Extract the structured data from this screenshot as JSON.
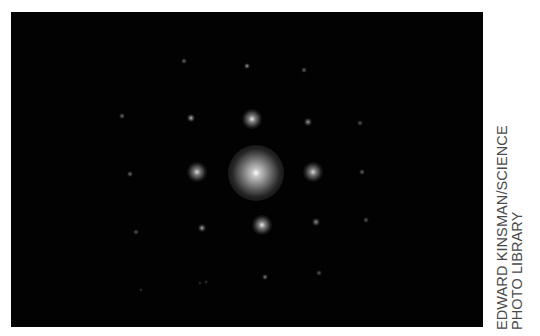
{
  "image": {
    "subject": "diffraction pattern",
    "background_color": "#020202",
    "spots": [
      {
        "x": 256,
        "y": 173,
        "r": 28,
        "intensity": 1.0,
        "kind": "central"
      },
      {
        "x": 252,
        "y": 119,
        "r": 10,
        "intensity": 0.9
      },
      {
        "x": 197,
        "y": 172,
        "r": 10,
        "intensity": 0.85
      },
      {
        "x": 313,
        "y": 172,
        "r": 10,
        "intensity": 0.85
      },
      {
        "x": 262,
        "y": 225,
        "r": 10,
        "intensity": 0.9
      },
      {
        "x": 191,
        "y": 118,
        "r": 4,
        "intensity": 0.75
      },
      {
        "x": 308,
        "y": 122,
        "r": 4,
        "intensity": 0.65
      },
      {
        "x": 202,
        "y": 228,
        "r": 4,
        "intensity": 0.7
      },
      {
        "x": 316,
        "y": 222,
        "r": 4,
        "intensity": 0.6
      },
      {
        "x": 247,
        "y": 66,
        "r": 3,
        "intensity": 0.65
      },
      {
        "x": 184,
        "y": 61,
        "r": 3,
        "intensity": 0.45
      },
      {
        "x": 304,
        "y": 70,
        "r": 3,
        "intensity": 0.45
      },
      {
        "x": 122,
        "y": 116,
        "r": 3,
        "intensity": 0.5
      },
      {
        "x": 130,
        "y": 174,
        "r": 3,
        "intensity": 0.5
      },
      {
        "x": 136,
        "y": 232,
        "r": 3,
        "intensity": 0.4
      },
      {
        "x": 360,
        "y": 123,
        "r": 3,
        "intensity": 0.4
      },
      {
        "x": 362,
        "y": 172,
        "r": 3,
        "intensity": 0.45
      },
      {
        "x": 366,
        "y": 220,
        "r": 3,
        "intensity": 0.4
      },
      {
        "x": 265,
        "y": 277,
        "r": 3,
        "intensity": 0.55
      },
      {
        "x": 206,
        "y": 282,
        "r": 2,
        "intensity": 0.3
      },
      {
        "x": 319,
        "y": 273,
        "r": 3,
        "intensity": 0.4
      },
      {
        "x": 200,
        "y": 283,
        "r": 2,
        "intensity": 0.25
      },
      {
        "x": 141,
        "y": 290,
        "r": 2,
        "intensity": 0.25
      }
    ]
  },
  "credit": {
    "line1": "EDWARD KINSMAN/SCIENCE",
    "line2": "PHOTO LIBRARY",
    "color": "#4a4a4a"
  }
}
